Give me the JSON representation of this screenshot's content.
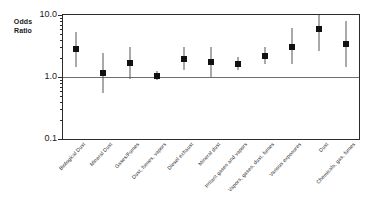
{
  "chart_data": {
    "type": "scatter",
    "title": "",
    "ylabel": "Odds Ratio",
    "xlabel": "",
    "yscale": "log",
    "ylim": [
      0.1,
      10.0
    ],
    "ytick_labels": [
      "10.0",
      "1.0",
      "0.1"
    ],
    "ytick_values": [
      10.0,
      1.0,
      0.1
    ],
    "reference_line": 1.0,
    "grid": false,
    "legend": "none",
    "categories": [
      "Biological Dust",
      "Mineral Dust",
      "Gases/Fumes",
      "Dust, fumes, vapors",
      "Diesel exhaust",
      "Mineral dust",
      "Irritant gases and vapors",
      "Vapors, gases, dust, fumes",
      "Various exposures",
      "Dust",
      "Chemicals, gas, fumes"
    ],
    "values": [
      2.8,
      1.15,
      1.7,
      1.05,
      1.95,
      1.75,
      1.65,
      2.2,
      3.1,
      6.0,
      3.4
    ],
    "ci_low": [
      1.45,
      0.55,
      0.92,
      0.9,
      1.3,
      1.0,
      1.3,
      1.65,
      1.6,
      2.6,
      1.45
    ],
    "ci_high": [
      5.4,
      2.4,
      3.1,
      1.25,
      3.0,
      3.1,
      2.1,
      3.0,
      6.2,
      14.0,
      8.0
    ]
  },
  "ylabel_text": "Odds\nRatio"
}
